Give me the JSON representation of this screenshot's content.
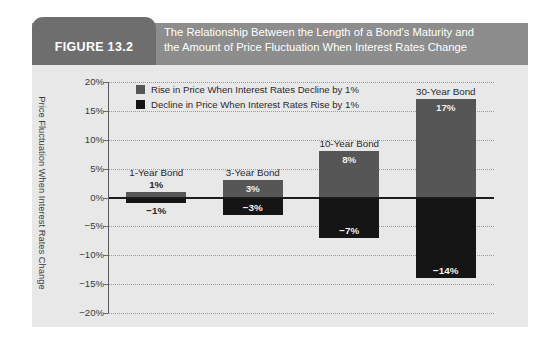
{
  "figure": {
    "tag": "FIGURE 13.2",
    "title_line1": "The Relationship Between the Length of a Bond's Maturity and",
    "title_line2": "the Amount of Price Fluctuation When Interest Rates Change"
  },
  "colors": {
    "header_band": "#8d8d8d",
    "figure_tag": "#6e6e6e",
    "panel_background": "#e8e8e8",
    "bar_positive": "#565656",
    "bar_negative": "#151515",
    "gridline": "#9a9a9a",
    "zero_line": "#1e1e1e",
    "text": "#2a2a2a"
  },
  "chart_data": {
    "type": "bar",
    "title": "The Relationship Between the Length of a Bond's Maturity and the Amount of Price Fluctuation When Interest Rates Change",
    "xlabel": "",
    "ylabel": "Price Fluctuation When Interest Rates Change",
    "ylim": [
      -20,
      20
    ],
    "yticks": [
      20,
      15,
      10,
      5,
      0,
      -5,
      -10,
      -15,
      -20
    ],
    "ytick_labels": [
      "20%",
      "15%",
      "10%",
      "5%",
      "0%",
      "−5%",
      "−10%",
      "−15%",
      "−20%"
    ],
    "grid": true,
    "legend_position": "top-left-inside",
    "categories": [
      "1-Year Bond",
      "3-Year Bond",
      "10-Year Bond",
      "30-Year Bond"
    ],
    "series": [
      {
        "name": "Rise in Price When Interest Rates Decline by 1%",
        "color": "#565656",
        "values": [
          1,
          3,
          8,
          17
        ],
        "value_labels": [
          "1%",
          "3%",
          "8%",
          "17%"
        ]
      },
      {
        "name": "Decline in Price When Interest Rates Rise by 1%",
        "color": "#151515",
        "values": [
          -1,
          -3,
          -7,
          -14
        ],
        "value_labels": [
          "−1%",
          "−3%",
          "−7%",
          "−14%"
        ]
      }
    ]
  },
  "legend": {
    "items": [
      {
        "label": "Rise in Price When Interest Rates Decline by 1%",
        "color": "#565656"
      },
      {
        "label": "Decline in Price When Interest Rates Rise by 1%",
        "color": "#151515"
      }
    ]
  },
  "bars": [
    {
      "category": "1-Year Bond",
      "pos_value": 1,
      "pos_label": "1%",
      "pos_label_outside": true,
      "neg_value": -1,
      "neg_label": "−1%",
      "neg_label_outside": true
    },
    {
      "category": "3-Year Bond",
      "pos_value": 3,
      "pos_label": "3%",
      "pos_label_outside": false,
      "neg_value": -3,
      "neg_label": "−3%",
      "neg_label_outside": false
    },
    {
      "category": "10-Year Bond",
      "pos_value": 8,
      "pos_label": "8%",
      "pos_label_outside": false,
      "neg_value": -7,
      "neg_label": "−7%",
      "neg_label_outside": false
    },
    {
      "category": "30-Year Bond",
      "pos_value": 17,
      "pos_label": "17%",
      "pos_label_outside": false,
      "neg_value": -14,
      "neg_label": "−14%",
      "neg_label_outside": false
    }
  ]
}
